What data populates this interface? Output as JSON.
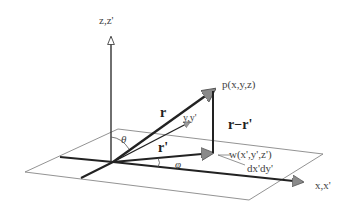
{
  "diagram": {
    "type": "3d-coordinate-vector-diagram",
    "labels": {
      "z_axis": "z,z'",
      "x_axis": "x,x'",
      "y_axis": "y,y'",
      "point_p": "p(x,y,z)",
      "point_w": "w(x',y',z')",
      "area_element": "dx'dy'",
      "vector_r": "r",
      "vector_r_prime": "r'",
      "vector_diff": "r−r'",
      "angle_theta": "θ",
      "angle_phi": "φ"
    },
    "colors": {
      "line": "#222222",
      "thin_line": "#666666",
      "arrowhead": "#888888",
      "text": "#444444",
      "background": "#ffffff"
    }
  }
}
